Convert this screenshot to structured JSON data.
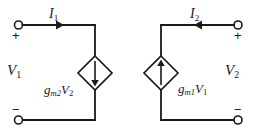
{
  "figure": {
    "background_color": "#ffffff",
    "line_color": "#1a1a1a",
    "text_color": "#1a1a1a"
  },
  "left_port": {
    "voltage_label": "V",
    "voltage_subscript": "1",
    "current_label": "I",
    "current_subscript": "1",
    "current_direction": "right",
    "top_polarity": "+",
    "bottom_polarity": "−",
    "top_terminal_name": "open-circle-terminal",
    "bottom_terminal_name": "open-circle-terminal"
  },
  "right_port": {
    "voltage_label": "V",
    "voltage_subscript": "2",
    "current_label": "I",
    "current_subscript": "2",
    "current_direction": "left",
    "top_polarity": "+",
    "bottom_polarity": "−",
    "top_terminal_name": "open-circle-terminal",
    "bottom_terminal_name": "open-circle-terminal"
  },
  "sources": [
    {
      "id": "left-dependent-source",
      "symbol": "diamond",
      "type": "voltage-controlled-current-source",
      "arrow_direction": "down",
      "gain_label": "g",
      "gain_subscript": "m2",
      "control_label": "V",
      "control_subscript": "2",
      "label_position": "left"
    },
    {
      "id": "right-dependent-source",
      "symbol": "diamond",
      "type": "voltage-controlled-current-source",
      "arrow_direction": "up",
      "gain_label": "g",
      "gain_subscript": "m1",
      "control_label": "V",
      "control_subscript": "1",
      "label_position": "right"
    }
  ]
}
